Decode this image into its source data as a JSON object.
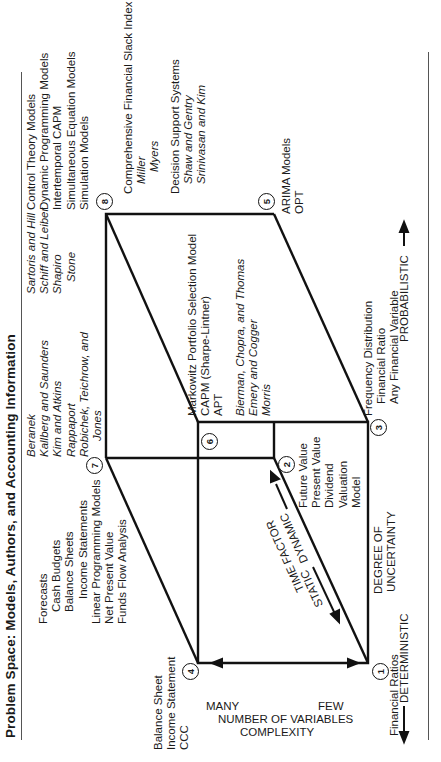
{
  "title": "Problem Space: Models, Authors, and Accounting Information",
  "corners": {
    "c1": "1",
    "c2": "2",
    "c3": "3",
    "c4": "4",
    "c5": "5",
    "c6": "6",
    "c7": "7",
    "c8": "8"
  },
  "corner_labels": {
    "c1": [
      "Financial Ratios"
    ],
    "c4": [
      "Balance Sheet",
      "Income Statement",
      "CCC"
    ],
    "c7_models": [
      "Forecasts",
      "Cash Budgets",
      "Balance Sheets",
      "Income Statements",
      "Linear Programming Models",
      "Net Present Value",
      "Funds Flow Analysis"
    ],
    "c7_authors": [
      "Beranek",
      "Kallberg and Saunders",
      "Kim and Atkins",
      "Rappaport",
      "Robichek, Teichrow, and",
      "Jones"
    ],
    "c2": [
      "Future Value",
      "Present Value",
      "Dividend",
      "Valuation",
      "Model"
    ],
    "c6_models": [
      "Markowitz Portfolio Selection Model",
      "CAPM (Sharpe-Lintner)",
      "APT"
    ],
    "c6_authors": [
      "Bierman, Chopra, and Thomas",
      "Emery and Cogger",
      "Morris"
    ],
    "c3": [
      "Frequency Distribution",
      "Financial Ratio",
      "Any Financial Variable"
    ],
    "c8_top_authors": [
      "Sartoris and Hill",
      "Schiff and Leiber",
      "Shapiro",
      "Stone"
    ],
    "c8_top_models": [
      "Control Theory Models",
      "Dynamic Programming Models",
      "Intertemporal CAPM",
      "Simultaneous Equation Models",
      "Simulation Models"
    ],
    "c8_models": [
      "Comprehensive Financial Slack Index"
    ],
    "c8_authors": [
      "Miller",
      "Myers"
    ],
    "c8_dss": [
      "Decision Support Systems"
    ],
    "c8_dss_authors": [
      "Shaw and Gentry",
      "Srinivasan and Kim"
    ],
    "c5": [
      "ARIMA Models",
      "OPT"
    ]
  },
  "axes": {
    "complexity": {
      "title": "COMPLEXITY",
      "subtitle": "NUMBER OF VARIABLES",
      "low": "FEW",
      "high": "MANY"
    },
    "time": {
      "title": "TIME FACTOR",
      "low": "STATIC",
      "high": "DYNAMIC"
    },
    "uncertainty": {
      "title_line1": "DEGREE OF",
      "title_line2": "UNCERTAINTY",
      "low": "DETERMINISTIC",
      "high": "PROBABILISTIC"
    }
  }
}
